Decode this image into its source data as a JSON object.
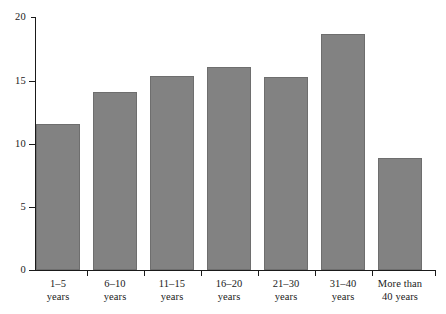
{
  "chart_data": {
    "type": "bar",
    "title": "",
    "subtitle": "",
    "xlabel": "",
    "ylabel": "",
    "ylim": [
      0,
      20
    ],
    "yticks": [
      0,
      5,
      10,
      15,
      20
    ],
    "grid": false,
    "legend": "none",
    "bar_color": "#828282",
    "bar_edge_color": "#6e6e6e",
    "axis_color": "#1a1a1a",
    "background": "#ffffff",
    "categories": [
      "1–5 years",
      "6–10 years",
      "11–15 years",
      "16–20 years",
      "21–30 years",
      "31–40 years",
      "More than 40 years"
    ],
    "category_lines": [
      {
        "line1": "1–5",
        "line2": "years"
      },
      {
        "line1": "6–10",
        "line2": "years"
      },
      {
        "line1": "11–15",
        "line2": "years"
      },
      {
        "line1": "16–20",
        "line2": "years"
      },
      {
        "line1": "21–30",
        "line2": "years"
      },
      {
        "line1": "31–40",
        "line2": "years"
      },
      {
        "line1": "More than",
        "line2": "40 years"
      }
    ],
    "values": [
      11.6,
      14.1,
      15.4,
      16.05,
      15.25,
      18.7,
      8.9
    ]
  },
  "axis": {
    "y_tick_labels": [
      "0",
      "5",
      "10",
      "15",
      "20"
    ]
  }
}
